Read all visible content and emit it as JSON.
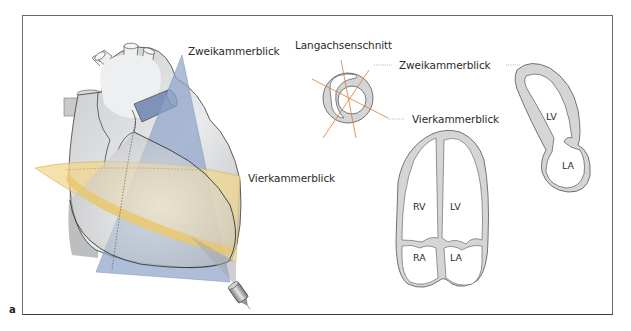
{
  "figure": {
    "panel_letter": "a",
    "colors": {
      "frame": "#6a6a6a",
      "heart_fill": "#d7d8da",
      "heart_light": "#eeeff0",
      "two_chamber_plane": "#8fa3c9",
      "four_chamber_plane": "#f1d68a",
      "short_axis_lines": "#e07a3a",
      "myocardium": "#d4d5d7",
      "outline": "#555555"
    }
  },
  "heart_3d": {
    "label_two_chamber": "Zweikammerblick",
    "label_four_chamber": "Vierkammerblick",
    "probe": "ultrasound-transducer"
  },
  "short_axis": {
    "title": "Langachsenschnitt",
    "label_two_chamber": "Zweikammerblick",
    "label_four_chamber": "Vierkammerblick"
  },
  "two_chamber_view": {
    "chambers": [
      "LV",
      "LA"
    ]
  },
  "four_chamber_view": {
    "chambers": [
      "RV",
      "LV",
      "RA",
      "LA"
    ]
  }
}
